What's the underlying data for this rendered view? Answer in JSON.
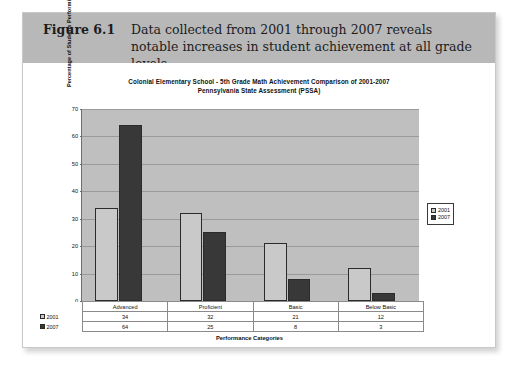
{
  "figure": {
    "number_label": "Figure 6.1",
    "caption": "Data collected from 2001 through 2007 reveals notable increases in student achievement at all grade levels."
  },
  "chart_data": {
    "type": "bar",
    "title": "Colonial Elementary School - 5th Grade Math Achievement Comparison of 2001-2007",
    "subtitle": "Pennsylvania State Assessment (PSSA)",
    "xlabel": "Performance Categories",
    "ylabel": "Percentage of Students Performing in Each Category",
    "categories": [
      "Advanced",
      "Proficient",
      "Basic",
      "Below Basic"
    ],
    "series": [
      {
        "name": "2001",
        "color": "#c9c9c9",
        "values": [
          34,
          32,
          21,
          12
        ]
      },
      {
        "name": "2007",
        "color": "#383838",
        "values": [
          64,
          25,
          8,
          3
        ]
      }
    ],
    "ylim": [
      0,
      70
    ],
    "yticks": [
      0,
      10,
      20,
      30,
      40,
      50,
      60,
      70
    ],
    "grid": true,
    "legend_position": "right",
    "plot_background": "#bfbfbf"
  },
  "table": {
    "columns": [
      "Advanced",
      "Proficient",
      "Basic",
      "Below Basic"
    ],
    "rows": [
      {
        "label": "2001",
        "values": [
          "34",
          "32",
          "21",
          "12"
        ]
      },
      {
        "label": "2007",
        "values": [
          "64",
          "25",
          "8",
          "3"
        ]
      }
    ]
  }
}
